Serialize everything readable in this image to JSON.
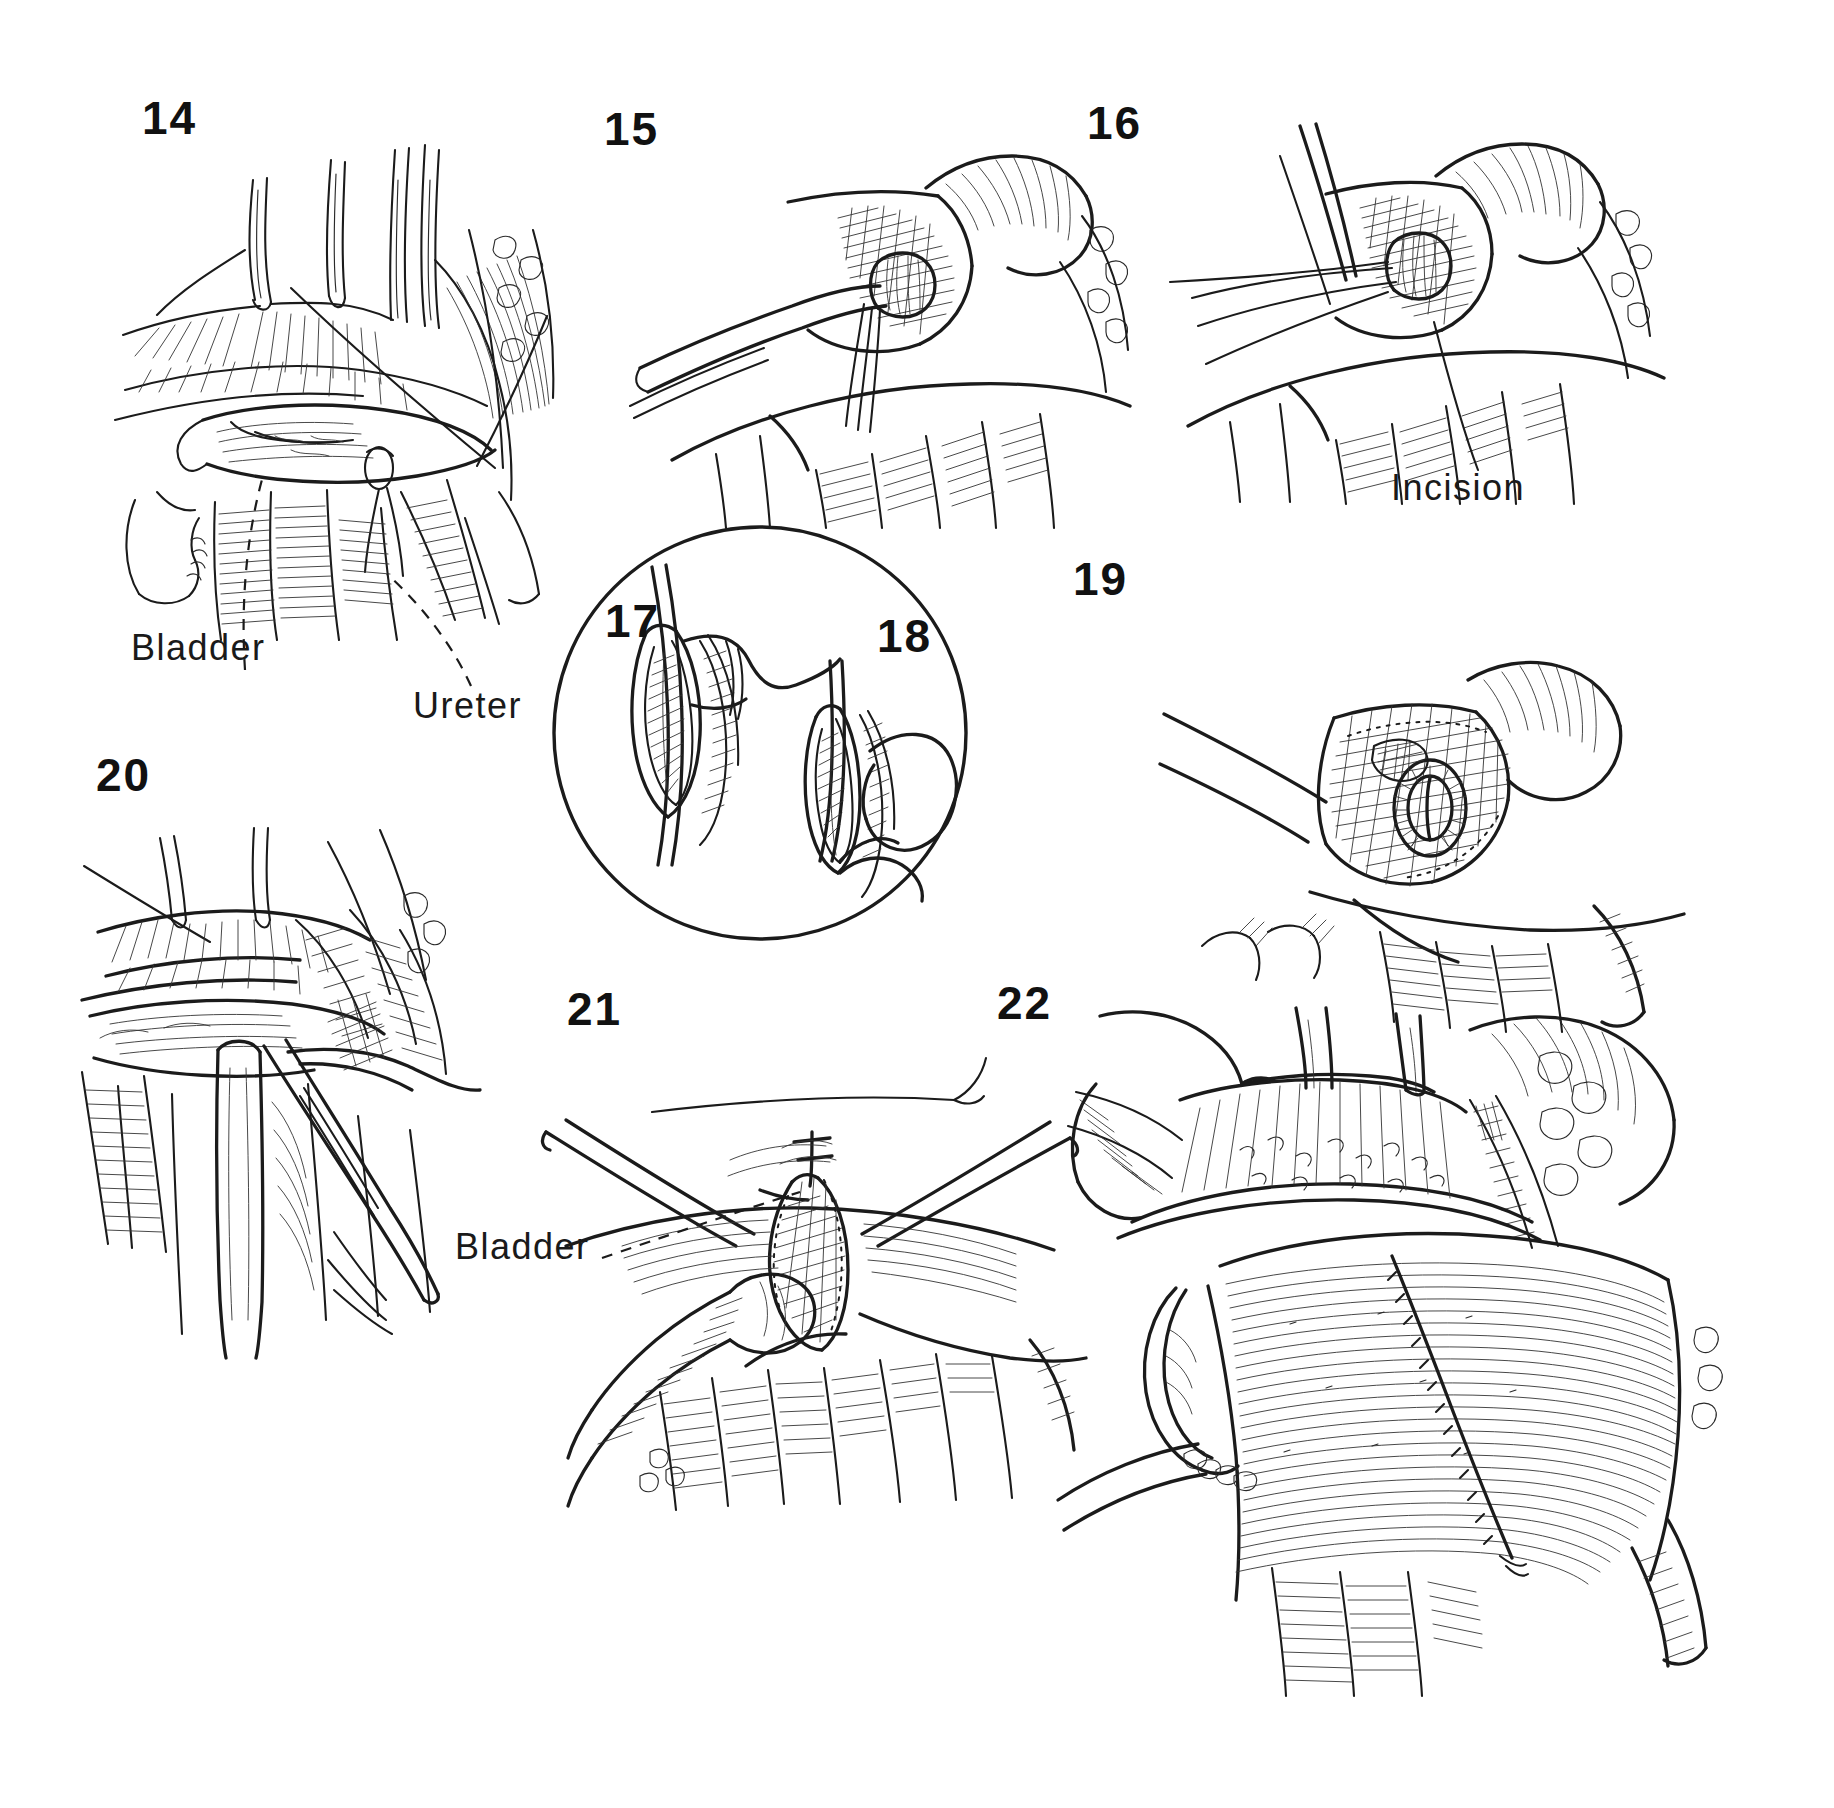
{
  "plate": {
    "title": "Surgical technique plate: ureteroneocystostomy, figures 14 through 22",
    "background_color": "#ffffff",
    "ink_color": "#1b1b1b",
    "width": 1834,
    "height": 1808,
    "style": "pen-and-ink line drawing, black on white, no color"
  },
  "figures": [
    {
      "number": "14",
      "x": 142,
      "y": 95,
      "caption_labels": [
        "Bladder",
        "Ureter"
      ],
      "description": "Bladder dome retracted with stay sutures and retractors; ureter coursing inferiorly"
    },
    {
      "number": "15",
      "x": 604,
      "y": 106,
      "caption_labels": [],
      "description": "Close view of bladder wall opening with right-angle clamp and traction suture"
    },
    {
      "number": "16",
      "x": 1087,
      "y": 100,
      "caption_labels": [
        "Incision"
      ],
      "description": "Needle and suture passing through bladder mucosa; incision indicated by leader line"
    },
    {
      "number": "17",
      "x": 605,
      "y": 598,
      "caption_labels": [],
      "description": "Magnified inset, left: mucosal cuff with needle and suture tail",
      "in_inset": true
    },
    {
      "number": "18",
      "x": 877,
      "y": 613,
      "caption_labels": [],
      "description": "Magnified inset, right: mucosal cuff with suture loop drawn through",
      "in_inset": true
    },
    {
      "number": "19",
      "x": 1073,
      "y": 556,
      "caption_labels": [],
      "description": "Completed mucosa-to-mucosa anastomosis seen through bladder opening"
    },
    {
      "number": "20",
      "x": 96,
      "y": 752,
      "caption_labels": [],
      "description": "Ureter held with forceps as submucosal tunnel is created"
    },
    {
      "number": "21",
      "x": 567,
      "y": 986,
      "caption_labels": [
        "Bladder"
      ],
      "description": "Bladder wall incision held open by two forceps, ureter drawn toward opening"
    },
    {
      "number": "22",
      "x": 997,
      "y": 980,
      "caption_labels": [],
      "description": "Completed closure of bladder wall with running suture line"
    }
  ],
  "annotations": [
    {
      "id": "bladder-14",
      "text": "Bladder",
      "x": 131,
      "y": 630,
      "leader": "dashed",
      "figure": "14"
    },
    {
      "id": "ureter-14",
      "text": "Ureter",
      "x": 413,
      "y": 688,
      "leader": "dashed",
      "figure": "14"
    },
    {
      "id": "incision-16",
      "text": "Incision",
      "x": 1391,
      "y": 470,
      "leader": "solid",
      "figure": "16"
    },
    {
      "id": "bladder-21",
      "text": "Bladder",
      "x": 455,
      "y": 1229,
      "leader": "dashed",
      "figure": "21"
    }
  ],
  "inset": {
    "shape": "circle",
    "center_x": 757,
    "center_y": 730,
    "radius": 207,
    "contains_figures": [
      "17",
      "18"
    ]
  }
}
